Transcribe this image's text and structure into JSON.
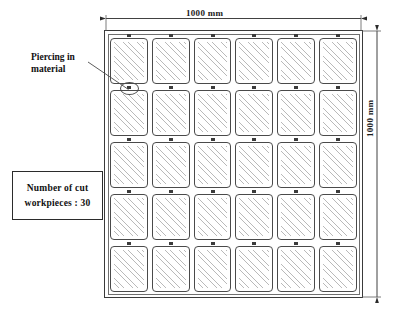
{
  "diagram": {
    "title_top_dimension": "1000 mm",
    "right_dimension": "1000 mm",
    "sheet": {
      "width_mm": 1000,
      "height_mm": 1000,
      "columns": 6,
      "rows": 5,
      "total_pieces": 30
    },
    "callout": {
      "line1": "Piercing in",
      "line2": "material",
      "target": "pierce-ring-row2-col1"
    },
    "count_box": {
      "line1": "Number  of  cut",
      "line2": "workpieces :  30"
    },
    "colors": {
      "sheet_border": "#3a3a3a",
      "piece_border": "#4a4a4a",
      "hatch": "#b9b9b9",
      "tab": "#3c3c3c",
      "text": "#111111",
      "background": "#ffffff"
    },
    "icons": {
      "top_dimension": "dimension-arrow-horizontal",
      "right_dimension": "dimension-arrow-vertical",
      "leader": "leader-line",
      "pierce": "pierce-ellipse-icon",
      "tab": "piercing-tab-icon"
    }
  }
}
